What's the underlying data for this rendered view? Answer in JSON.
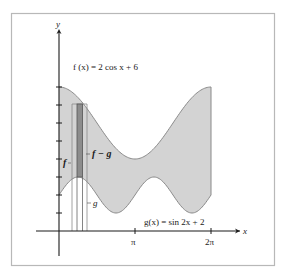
{
  "figure": {
    "frame_color": "#b8b8b8",
    "fill_color": "#d3d3d3",
    "curve_color": "#8a8a8a",
    "axis_color": "#1a1a1a",
    "strip_dark_color": "#8c8c8c",
    "strip_light_color": "#c6c6c6"
  },
  "labels": {
    "y_axis": "y",
    "x_axis": "x",
    "f_equation": "f (x) = 2 cos x + 6",
    "g_equation": "g(x) = sin 2x + 2",
    "f_label": "f",
    "f_minus_g_label": "f − g",
    "g_label": "g",
    "tick_pi": "π",
    "tick_2pi": "2π"
  },
  "chart_data": {
    "type": "area",
    "xlabel": "x",
    "ylabel": "y",
    "xlim": [
      0,
      6.2832
    ],
    "ylim": [
      0,
      8
    ],
    "x_ticks": [
      "π",
      "2π"
    ],
    "y_ticks": [
      1,
      2,
      3,
      4,
      5,
      6,
      7,
      8
    ],
    "series": [
      {
        "name": "f(x) = 2 cos x + 6",
        "x": [
          0,
          0.785,
          1.571,
          2.356,
          3.1416,
          3.927,
          4.712,
          5.498,
          6.2832
        ],
        "values": [
          8,
          7.41,
          6,
          4.59,
          4,
          4.59,
          6,
          7.41,
          8
        ]
      },
      {
        "name": "g(x) = sin 2x + 2",
        "x": [
          0,
          0.785,
          1.571,
          2.356,
          3.1416,
          3.927,
          4.712,
          5.498,
          6.2832
        ],
        "values": [
          2,
          3,
          2,
          1,
          2,
          3,
          2,
          1,
          2
        ]
      }
    ],
    "annotations": [
      "f",
      "f − g",
      "g",
      "representative rectangle of width Δx"
    ]
  }
}
